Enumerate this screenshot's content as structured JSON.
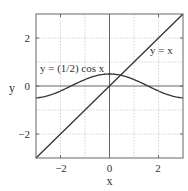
{
  "chart_data": {
    "type": "line",
    "title": "",
    "xlabel": "x",
    "ylabel": "y",
    "xlim": [
      -3,
      3
    ],
    "ylim": [
      -3,
      3
    ],
    "grid": true,
    "grid_style": "dotted",
    "grid_x": [
      -2,
      -1,
      1,
      2
    ],
    "grid_y": [
      -2,
      -1,
      1,
      2
    ],
    "x_ticks": [
      -2,
      0,
      2
    ],
    "y_ticks": [
      -2,
      0,
      2
    ],
    "x_tick_labels": [
      "−2",
      "0",
      "2"
    ],
    "y_tick_labels": [
      "−2",
      "0",
      "2"
    ],
    "legend": null,
    "series": [
      {
        "name": "y = x",
        "expression": "x",
        "x": [
          -3,
          -2,
          -1,
          0,
          1,
          2,
          3
        ],
        "values": [
          -3,
          -2,
          -1,
          0,
          1,
          2,
          3
        ],
        "color": "#333333"
      },
      {
        "name": "y = (1/2) cos x",
        "expression": "0.5*cos(x)",
        "x": [
          -3,
          -2,
          -1.5708,
          -1,
          0,
          1,
          1.5708,
          2,
          3
        ],
        "values": [
          -0.495,
          -0.208,
          0,
          0.27,
          0.5,
          0.27,
          0,
          -0.208,
          -0.495
        ],
        "color": "#333333"
      }
    ],
    "annotations": [
      {
        "text": "y = (1/2) cos x",
        "x": -2.95,
        "y": 0.75
      },
      {
        "text": "y = x",
        "x": 1.75,
        "y": 1.45
      }
    ],
    "intersection": {
      "x": 0.45,
      "y": 0.45
    }
  },
  "labels": {
    "xlabel": "x",
    "ylabel": "y",
    "xticks": [
      "−2",
      "0",
      "2"
    ],
    "yticks": [
      "2",
      "0",
      "−2"
    ],
    "annot_cos": "y = (1/2) cos x",
    "annot_line": "y = x"
  },
  "colors": {
    "curve": "#333333",
    "axis": "#555555",
    "grid": "#c8c8c8",
    "frame": "#666666"
  }
}
